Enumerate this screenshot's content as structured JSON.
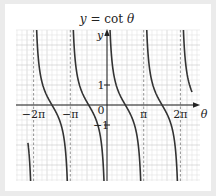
{
  "chart_data": {
    "type": "line",
    "title": "y = cot θ",
    "xlabel": "θ",
    "ylabel": "y",
    "function": "cot",
    "x_tick_labels": [
      {
        "value": -6.2832,
        "label": "−2π"
      },
      {
        "value": -3.1416,
        "label": "−π"
      },
      {
        "value": 0,
        "label": "0"
      },
      {
        "value": 3.1416,
        "label": "π"
      },
      {
        "value": 6.2832,
        "label": "2π"
      }
    ],
    "y_tick_labels": [
      {
        "value": 1,
        "label": "1"
      },
      {
        "value": -1,
        "label": "−1"
      }
    ],
    "asymptotes": [
      -6.2832,
      -3.1416,
      0,
      3.1416,
      6.2832
    ],
    "xlim": [
      -7.77,
      8.0
    ],
    "ylim": [
      -3.8,
      3.75
    ],
    "visible_domain": [
      -6.77,
      7.28
    ],
    "grid": true,
    "grid_minor_step_px": 5,
    "grid_major_step_px": 20,
    "colors": {
      "curve": "#333333",
      "axis": "#222222",
      "grid_minor": "#e2e2e2",
      "grid_major": "#c8c8c8",
      "asymptote": "#777777",
      "background": "#ffffff",
      "frame": "#ebebeb"
    },
    "series": [
      {
        "name": "cot θ",
        "samples": [
          {
            "x": -5.5,
            "y": -1.0
          },
          {
            "x": -4.71,
            "y": 0
          },
          {
            "x": -3.93,
            "y": 1.0
          },
          {
            "x": -2.36,
            "y": -1.0
          },
          {
            "x": -1.57,
            "y": 0
          },
          {
            "x": -0.79,
            "y": 1.0
          },
          {
            "x": 0.79,
            "y": 1.0
          },
          {
            "x": 1.57,
            "y": 0
          },
          {
            "x": 2.36,
            "y": -1.0
          },
          {
            "x": 3.93,
            "y": 1.0
          },
          {
            "x": 4.71,
            "y": 0
          },
          {
            "x": 5.5,
            "y": -1.0
          },
          {
            "x": 7.07,
            "y": 1.0
          }
        ]
      }
    ]
  }
}
